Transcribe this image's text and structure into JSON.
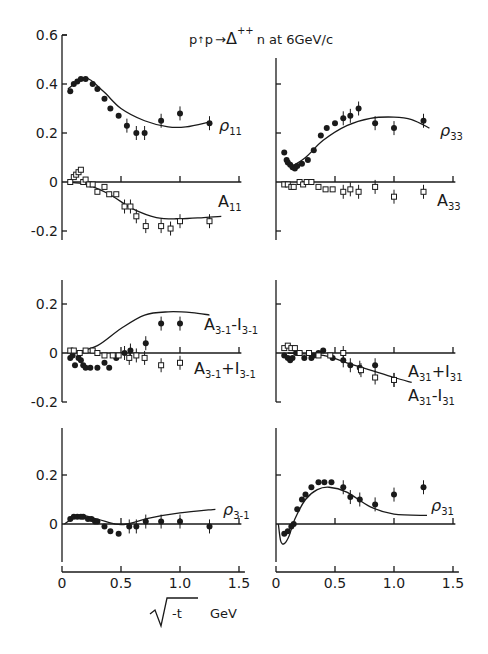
{
  "title": {
    "prefix": "p",
    "arrow_up": "↑",
    "mid": "p",
    "arrow": "→",
    "delta": "Δ",
    "sup": "++",
    "suffix": "n at 6GeV/c"
  },
  "xlabel": {
    "root": "√",
    "var": "-t",
    "unit": "GeV"
  },
  "colors": {
    "ink": "#1a1a1a",
    "background": "#ffffff"
  },
  "chart_data": [
    {
      "type": "scatter",
      "panel": "top-left",
      "title": "p↑p → Δ++ n at 6GeV/c",
      "xlabel": "√-t GeV",
      "ylim": [
        -0.25,
        0.6
      ],
      "xlim": [
        0,
        1.5
      ],
      "yticks": [
        0.6,
        0.4,
        0.2,
        0,
        -0.2
      ],
      "ytick_labels": [
        "0.6",
        "0.4",
        "0.2",
        "0",
        "-0.2"
      ],
      "series": [
        {
          "name": "ρ11",
          "marker": "filled",
          "x": [
            0.07,
            0.1,
            0.13,
            0.16,
            0.2,
            0.26,
            0.3,
            0.36,
            0.41,
            0.48,
            0.55,
            0.63,
            0.7,
            0.84,
            1.0,
            1.25
          ],
          "y": [
            0.37,
            0.4,
            0.41,
            0.42,
            0.42,
            0.4,
            0.38,
            0.34,
            0.3,
            0.27,
            0.23,
            0.2,
            0.2,
            0.25,
            0.28,
            0.24
          ],
          "fit": [
            [
              0.05,
              0.38
            ],
            [
              0.2,
              0.425
            ],
            [
              0.35,
              0.37
            ],
            [
              0.5,
              0.3
            ],
            [
              0.7,
              0.25
            ],
            [
              0.9,
              0.225
            ],
            [
              1.05,
              0.225
            ],
            [
              1.25,
              0.245
            ]
          ]
        },
        {
          "name": "A11",
          "marker": "open",
          "x": [
            0.07,
            0.1,
            0.12,
            0.14,
            0.16,
            0.18,
            0.2,
            0.23,
            0.26,
            0.3,
            0.36,
            0.4,
            0.46,
            0.53,
            0.58,
            0.63,
            0.71,
            0.84,
            0.92,
            1.0,
            1.25
          ],
          "y": [
            0.0,
            0.02,
            0.03,
            0.04,
            0.05,
            0.0,
            0.01,
            -0.01,
            -0.01,
            -0.04,
            -0.02,
            -0.05,
            -0.05,
            -0.1,
            -0.1,
            -0.14,
            -0.18,
            -0.18,
            -0.19,
            -0.16,
            -0.16
          ],
          "fit": [
            [
              0.05,
              0.0
            ],
            [
              0.2,
              -0.01
            ],
            [
              0.4,
              -0.05
            ],
            [
              0.6,
              -0.11
            ],
            [
              0.8,
              -0.145
            ],
            [
              1.0,
              -0.15
            ],
            [
              1.2,
              -0.145
            ],
            [
              1.35,
              -0.14
            ]
          ]
        }
      ],
      "annotations": [
        "ρ11",
        "A11"
      ]
    },
    {
      "type": "scatter",
      "panel": "top-right",
      "ylim": [
        -0.25,
        0.6
      ],
      "xlim": [
        0,
        1.5
      ],
      "series": [
        {
          "name": "ρ33",
          "marker": "filled",
          "x": [
            0.07,
            0.09,
            0.1,
            0.12,
            0.14,
            0.16,
            0.18,
            0.22,
            0.27,
            0.32,
            0.38,
            0.43,
            0.5,
            0.57,
            0.63,
            0.7,
            0.84,
            1.0,
            1.25
          ],
          "y": [
            0.12,
            0.09,
            0.08,
            0.07,
            0.06,
            0.055,
            0.065,
            0.075,
            0.09,
            0.13,
            0.19,
            0.22,
            0.24,
            0.26,
            0.27,
            0.3,
            0.24,
            0.22,
            0.25
          ],
          "fit": [
            [
              0.12,
              0.06
            ],
            [
              0.25,
              0.1
            ],
            [
              0.4,
              0.17
            ],
            [
              0.6,
              0.23
            ],
            [
              0.8,
              0.26
            ],
            [
              1.0,
              0.265
            ],
            [
              1.15,
              0.255
            ],
            [
              1.3,
              0.22
            ]
          ]
        },
        {
          "name": "A33",
          "marker": "open",
          "x": [
            0.07,
            0.1,
            0.13,
            0.15,
            0.2,
            0.23,
            0.26,
            0.3,
            0.36,
            0.42,
            0.48,
            0.57,
            0.63,
            0.7,
            0.84,
            1.0,
            1.25
          ],
          "y": [
            -0.01,
            -0.01,
            -0.02,
            -0.02,
            0.0,
            -0.01,
            0.0,
            0.0,
            -0.02,
            -0.03,
            -0.03,
            -0.04,
            -0.03,
            -0.04,
            -0.02,
            -0.06,
            -0.04
          ],
          "fit": []
        }
      ],
      "annotations": [
        "ρ33",
        "A33"
      ]
    },
    {
      "type": "scatter",
      "panel": "middle-left",
      "ylim": [
        -0.2,
        0.3
      ],
      "xlim": [
        0,
        1.5
      ],
      "yticks": [
        0.2,
        0,
        -0.2
      ],
      "ytick_labels": [
        "0.2",
        "0",
        "-0.2"
      ],
      "series": [
        {
          "name": "A3-1 - I3-1",
          "marker": "filled",
          "x": [
            0.07,
            0.09,
            0.11,
            0.14,
            0.16,
            0.18,
            0.2,
            0.24,
            0.3,
            0.36,
            0.4,
            0.46,
            0.53,
            0.58,
            0.71,
            0.84,
            1.0
          ],
          "y": [
            -0.02,
            -0.01,
            -0.05,
            -0.02,
            -0.03,
            -0.05,
            -0.06,
            -0.06,
            -0.06,
            -0.04,
            -0.06,
            -0.02,
            0.0,
            0.01,
            0.04,
            0.12,
            0.12
          ],
          "fit": [
            [
              0.1,
              0.0
            ],
            [
              0.3,
              0.03
            ],
            [
              0.5,
              0.1
            ],
            [
              0.7,
              0.155
            ],
            [
              0.9,
              0.168
            ],
            [
              1.1,
              0.165
            ],
            [
              1.25,
              0.155
            ]
          ]
        },
        {
          "name": "A3-1 + I3-1",
          "marker": "open",
          "x": [
            0.07,
            0.1,
            0.15,
            0.2,
            0.26,
            0.3,
            0.36,
            0.43,
            0.48,
            0.57,
            0.63,
            0.7,
            0.84,
            1.0
          ],
          "y": [
            0.01,
            0.01,
            0.0,
            0.01,
            0.01,
            0.0,
            -0.01,
            -0.01,
            -0.01,
            -0.02,
            -0.01,
            -0.02,
            -0.05,
            -0.04
          ],
          "fit": []
        }
      ],
      "annotations": [
        "A3-1 - I3-1",
        "A3-1 + I3-1"
      ]
    },
    {
      "type": "scatter",
      "panel": "middle-right",
      "ylim": [
        -0.2,
        0.3
      ],
      "xlim": [
        0,
        1.5
      ],
      "series": [
        {
          "name": "A31 + I31",
          "marker": "filled",
          "x": [
            0.07,
            0.1,
            0.12,
            0.14,
            0.17,
            0.2,
            0.24,
            0.3,
            0.32,
            0.36,
            0.4,
            0.48,
            0.57,
            0.63,
            0.71,
            0.84,
            1.0
          ],
          "y": [
            -0.01,
            -0.02,
            -0.03,
            -0.02,
            0.0,
            0.0,
            -0.02,
            -0.02,
            -0.01,
            0.0,
            0.01,
            -0.02,
            -0.03,
            -0.05,
            -0.06,
            -0.05,
            -0.11
          ],
          "fit": [
            [
              0.1,
              0.0
            ],
            [
              0.4,
              -0.01
            ],
            [
              0.6,
              -0.04
            ],
            [
              0.8,
              -0.07
            ],
            [
              1.0,
              -0.1
            ],
            [
              1.15,
              -0.12
            ]
          ]
        },
        {
          "name": "A31 - I31",
          "marker": "open",
          "x": [
            0.07,
            0.1,
            0.13,
            0.16,
            0.2,
            0.28,
            0.36,
            0.46,
            0.57,
            0.72,
            0.84,
            1.0
          ],
          "y": [
            0.02,
            0.03,
            0.02,
            0.02,
            0.0,
            0.0,
            -0.01,
            -0.01,
            0.0,
            -0.07,
            -0.1,
            -0.11
          ],
          "fit": []
        }
      ],
      "annotations": [
        "A31 + I31",
        "A31 - I31"
      ]
    },
    {
      "type": "scatter",
      "panel": "bottom-left",
      "ylim": [
        -0.15,
        0.4
      ],
      "xlim": [
        0,
        1.5
      ],
      "xticks": [
        0,
        0.5,
        1.0,
        1.5
      ],
      "xtick_labels": [
        "0",
        "0.5",
        "1.0",
        "1.5"
      ],
      "yticks": [
        0.2,
        0
      ],
      "ytick_labels": [
        "0.2",
        "0"
      ],
      "series": [
        {
          "name": "ρ3-1",
          "marker": "filled",
          "x": [
            0.07,
            0.1,
            0.13,
            0.16,
            0.18,
            0.22,
            0.25,
            0.28,
            0.3,
            0.36,
            0.41,
            0.48,
            0.57,
            0.63,
            0.71,
            0.84,
            1.0,
            1.25
          ],
          "y": [
            0.02,
            0.03,
            0.03,
            0.03,
            0.03,
            0.02,
            0.02,
            0.01,
            0.01,
            -0.01,
            -0.03,
            -0.04,
            -0.01,
            -0.01,
            0.01,
            0.01,
            0.01,
            -0.01
          ],
          "fit": [
            [
              0.02,
              0.0
            ],
            [
              0.15,
              0.035
            ],
            [
              0.3,
              0.02
            ],
            [
              0.45,
              0.0
            ],
            [
              0.55,
              0.0
            ],
            [
              0.75,
              0.025
            ],
            [
              1.0,
              0.045
            ],
            [
              1.3,
              0.06
            ]
          ]
        }
      ],
      "annotations": [
        "ρ3-1"
      ]
    },
    {
      "type": "scatter",
      "panel": "bottom-right",
      "ylim": [
        -0.15,
        0.4
      ],
      "xlim": [
        0,
        1.5
      ],
      "xticks": [
        0,
        0.5,
        1.0,
        1.5
      ],
      "xtick_labels": [
        "0",
        "0.5",
        "1.0",
        "1.5"
      ],
      "series": [
        {
          "name": "ρ31",
          "marker": "filled",
          "x": [
            0.07,
            0.1,
            0.13,
            0.15,
            0.18,
            0.22,
            0.25,
            0.3,
            0.36,
            0.41,
            0.47,
            0.57,
            0.63,
            0.71,
            0.84,
            1.0,
            1.25
          ],
          "y": [
            -0.04,
            -0.03,
            -0.01,
            0.0,
            0.06,
            0.1,
            0.12,
            0.15,
            0.17,
            0.17,
            0.17,
            0.15,
            0.11,
            0.1,
            0.08,
            0.12,
            0.15
          ],
          "fit": [
            [
              0.02,
              0.0
            ],
            [
              0.04,
              -0.07
            ],
            [
              0.07,
              -0.08
            ],
            [
              0.11,
              -0.05
            ],
            [
              0.16,
              0.02
            ],
            [
              0.25,
              0.1
            ],
            [
              0.35,
              0.14
            ],
            [
              0.45,
              0.15
            ],
            [
              0.6,
              0.13
            ],
            [
              0.8,
              0.07
            ],
            [
              1.0,
              0.04
            ],
            [
              1.28,
              0.035
            ]
          ]
        }
      ],
      "annotations": [
        "ρ31"
      ]
    }
  ],
  "labels": {
    "rho11": {
      "base": "ρ",
      "sub": "11"
    },
    "A11": {
      "base": "A",
      "sub": "11"
    },
    "rho33": {
      "base": "ρ",
      "sub": "33"
    },
    "A33": {
      "base": "A",
      "sub": "33"
    },
    "A3m1_minus": {
      "base": "A",
      "sub": "3-1",
      "op": "-I",
      "sub2": "3-1"
    },
    "A3m1_plus": {
      "base": "A",
      "sub": "3-1",
      "op": "+I",
      "sub2": "3-1"
    },
    "A31_plus": {
      "base": "A",
      "sub": "31",
      "op": "+I",
      "sub2": "31"
    },
    "A31_minus": {
      "base": "A",
      "sub": "31",
      "op": "-I",
      "sub2": "31"
    },
    "rho3m1": {
      "base": "ρ",
      "sub": "3-1"
    },
    "rho31": {
      "base": "ρ",
      "sub": "31"
    }
  }
}
